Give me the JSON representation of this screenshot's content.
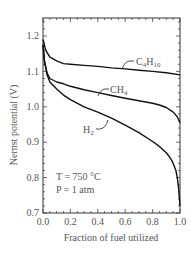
{
  "chart_data": {
    "type": "line",
    "title": "",
    "xlabel": "Fraction of fuel utilized",
    "ylabel": "Nernst potential (V)",
    "xlim": [
      0.0,
      1.0
    ],
    "ylim": [
      0.7,
      1.25
    ],
    "x_ticks": [
      "0.0",
      "0.2",
      "0.4",
      "0.6",
      "0.8",
      "1.0"
    ],
    "y_ticks": [
      "0.7",
      "0.8",
      "0.9",
      "1.0",
      "1.1",
      "1.2"
    ],
    "grid": false,
    "legend": "inline labels",
    "annotations": [
      "T = 750 °C",
      "P = 1 atm"
    ],
    "series": [
      {
        "name": "C4H10",
        "label_main": "C",
        "label_sub1": "4",
        "label_mid": "H",
        "label_sub2": "10",
        "x": [
          0.0,
          0.02,
          0.05,
          0.1,
          0.15,
          0.2,
          0.3,
          0.4,
          0.5,
          0.6,
          0.7,
          0.8,
          0.9,
          1.0
        ],
        "y": [
          1.19,
          1.16,
          1.14,
          1.13,
          1.122,
          1.12,
          1.117,
          1.114,
          1.11,
          1.107,
          1.103,
          1.1,
          1.096,
          1.09
        ]
      },
      {
        "name": "CH4",
        "label_main": "CH",
        "label_sub1": "4",
        "x": [
          0.0,
          0.01,
          0.03,
          0.05,
          0.1,
          0.15,
          0.2,
          0.3,
          0.4,
          0.5,
          0.6,
          0.7,
          0.8,
          0.85,
          0.9,
          0.95,
          0.98,
          1.0
        ],
        "y": [
          1.175,
          1.13,
          1.095,
          1.08,
          1.07,
          1.065,
          1.058,
          1.048,
          1.04,
          1.032,
          1.024,
          1.017,
          1.01,
          1.005,
          0.998,
          0.985,
          0.972,
          0.955
        ]
      },
      {
        "name": "H2",
        "label_main": "H",
        "label_sub1": "2",
        "x": [
          0.0,
          0.01,
          0.03,
          0.05,
          0.1,
          0.15,
          0.2,
          0.3,
          0.4,
          0.5,
          0.6,
          0.7,
          0.8,
          0.85,
          0.9,
          0.93,
          0.95,
          0.97,
          0.98,
          0.99,
          1.0
        ],
        "y": [
          1.175,
          1.13,
          1.09,
          1.07,
          1.05,
          1.033,
          1.02,
          1.0,
          0.985,
          0.968,
          0.948,
          0.927,
          0.902,
          0.888,
          0.87,
          0.855,
          0.84,
          0.82,
          0.8,
          0.77,
          0.72
        ]
      }
    ]
  }
}
